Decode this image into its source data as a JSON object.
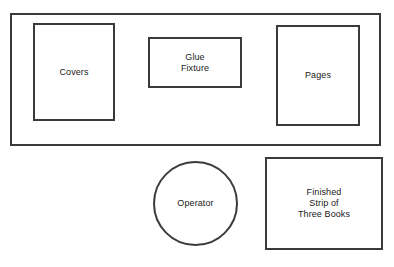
{
  "diagram": {
    "type": "workstation-layout",
    "background_color": "#ffffff",
    "stroke_color": "#3a3a3a",
    "text_color": "#1a1a1a",
    "canvas": {
      "width": 394,
      "height": 267
    },
    "shapes": [
      {
        "id": "workbench",
        "kind": "rectangle",
        "label": "",
        "x": 10,
        "y": 13,
        "width": 371,
        "height": 133
      },
      {
        "id": "covers",
        "kind": "rectangle",
        "label": "Covers",
        "x": 33,
        "y": 23,
        "width": 82,
        "height": 98
      },
      {
        "id": "glue-fixture",
        "kind": "rectangle",
        "label": "Glue\nFixture",
        "x": 148,
        "y": 37,
        "width": 94,
        "height": 51
      },
      {
        "id": "pages",
        "kind": "rectangle",
        "label": "Pages",
        "x": 276,
        "y": 25,
        "width": 84,
        "height": 101
      },
      {
        "id": "operator",
        "kind": "circle",
        "label": "Operator",
        "x": 153,
        "y": 161,
        "width": 85,
        "height": 85
      },
      {
        "id": "finished-strip",
        "kind": "rectangle",
        "label": "Finished\nStrip of\nThree Books",
        "x": 265,
        "y": 157,
        "width": 118,
        "height": 93
      }
    ]
  }
}
